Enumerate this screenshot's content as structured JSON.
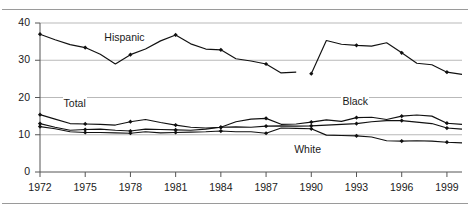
{
  "figure": {
    "title_fragment": "",
    "rules": {
      "top": true,
      "bottom": true
    }
  },
  "axes": {
    "y_ticks": [
      "0",
      "10",
      "20",
      "30",
      "40"
    ],
    "x_ticks": [
      "1972",
      "1975",
      "1978",
      "1981",
      "1984",
      "1987",
      "1990",
      "1993",
      "1996",
      "1999"
    ]
  },
  "series_labels": {
    "hispanic": "Hispanic",
    "total": "Total",
    "black": "Black",
    "white": "White"
  },
  "colors": {
    "line": "#111111",
    "grid": "#b9b9b9",
    "axis": "#555555",
    "text": "#1a1a1a"
  },
  "chart_data": {
    "type": "line",
    "title": "",
    "subtitle": "",
    "xlabel": "",
    "ylabel": "",
    "xlim": [
      1972,
      2000
    ],
    "ylim": [
      0,
      40
    ],
    "yticks": [
      0,
      10,
      20,
      30,
      40
    ],
    "xticks": [
      1972,
      1975,
      1978,
      1981,
      1984,
      1987,
      1990,
      1993,
      1996,
      1999
    ],
    "grid": true,
    "grid_axis": "y",
    "legend": "inline-labels",
    "marker": "diamond",
    "x": [
      1972,
      1973,
      1974,
      1975,
      1976,
      1977,
      1978,
      1979,
      1980,
      1981,
      1982,
      1983,
      1984,
      1985,
      1986,
      1987,
      1988,
      1989,
      1990,
      1991,
      1992,
      1993,
      1994,
      1995,
      1996,
      1997,
      1998,
      1999,
      2000
    ],
    "series": [
      {
        "name": "Hispanic",
        "label_x": 1976.2,
        "label_y": 36.0,
        "break_after_x": 1989,
        "values": [
          37.0,
          35.5,
          34.2,
          33.4,
          31.6,
          29.0,
          31.5,
          33.0,
          35.2,
          36.8,
          34.4,
          33.0,
          32.8,
          30.4,
          29.8,
          29.0,
          26.6,
          26.8,
          26.4,
          35.3,
          34.3,
          34.0,
          33.8,
          34.7,
          32.0,
          29.2,
          28.8,
          26.8,
          26.2
        ]
      },
      {
        "name": "Black",
        "label_x": 1992.0,
        "label_y": 18.8,
        "values": [
          15.4,
          14.2,
          13.0,
          12.9,
          12.8,
          12.6,
          13.5,
          14.1,
          13.3,
          12.6,
          12.0,
          11.8,
          12.0,
          13.5,
          14.2,
          14.4,
          12.8,
          12.9,
          13.4,
          14.0,
          13.6,
          14.6,
          14.7,
          14.1,
          15.0,
          15.3,
          15.0,
          13.1,
          12.8
        ]
      },
      {
        "name": "Total",
        "label_x": 1973.5,
        "label_y": 18.3,
        "values": [
          13.0,
          12.0,
          11.2,
          11.4,
          11.5,
          11.2,
          11.0,
          11.5,
          11.4,
          11.3,
          11.2,
          11.5,
          12.0,
          12.1,
          12.0,
          12.3,
          12.4,
          12.3,
          12.4,
          12.6,
          12.8,
          13.0,
          13.5,
          13.8,
          13.8,
          13.4,
          13.0,
          11.8,
          11.5
        ]
      },
      {
        "name": "White",
        "label_x": 1988.8,
        "label_y": 6.0,
        "values": [
          12.2,
          11.6,
          10.8,
          10.6,
          10.6,
          10.5,
          10.4,
          10.8,
          10.5,
          10.6,
          10.7,
          10.8,
          11.0,
          10.8,
          10.8,
          10.4,
          11.8,
          11.7,
          11.6,
          9.9,
          9.8,
          9.7,
          9.4,
          8.4,
          8.3,
          8.4,
          8.3,
          8.0,
          7.8
        ]
      }
    ]
  }
}
